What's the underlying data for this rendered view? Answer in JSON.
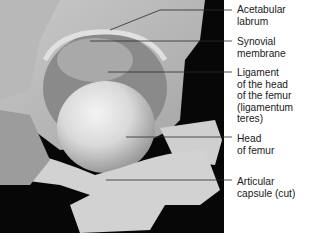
{
  "figure": {
    "labels": [
      {
        "id": "acetabular-labrum",
        "text": "Acetabular\nlabrum",
        "top": 4,
        "line": {
          "x1": 110,
          "y1": 30,
          "x2": 160,
          "y2": 10,
          "x3": 232
        }
      },
      {
        "id": "synovial-membrane",
        "text": "Synovial\nmembrane",
        "top": 36,
        "line": {
          "x1": 90,
          "y1": 41,
          "x2": 232,
          "y2": 41
        }
      },
      {
        "id": "ligament-head-femur",
        "text": "Ligament\nof the head\nof the femur\n(ligamentum\nteres)",
        "top": 67,
        "line": {
          "x1": 108,
          "y1": 72,
          "x2": 232,
          "y2": 72
        }
      },
      {
        "id": "head-of-femur",
        "text": "Head\nof femur",
        "top": 133,
        "line": {
          "x1": 126,
          "y1": 137,
          "x2": 232,
          "y2": 137
        }
      },
      {
        "id": "articular-capsule",
        "text": "Articular\ncapsule (cut)",
        "top": 176,
        "line": {
          "x1": 106,
          "y1": 180,
          "x2": 232,
          "y2": 180
        }
      }
    ]
  }
}
